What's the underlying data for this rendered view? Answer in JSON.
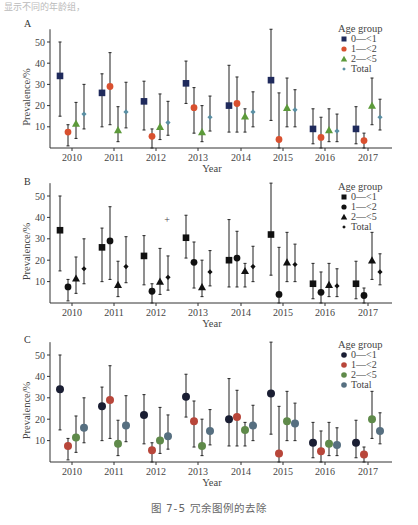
{
  "header": {
    "top_text": "显示不同的年龄组，"
  },
  "caption": "图 7-5   冗余图例的去除",
  "legend": {
    "title": "Age group",
    "items": [
      "0—<1",
      "1—<2",
      "2—<5",
      "Total"
    ]
  },
  "colors": {
    "a": [
      "#1f2a5c",
      "#d9502f",
      "#5c9a3a",
      "#5a8fa3"
    ],
    "b": [
      "#111111",
      "#111111",
      "#111111",
      "#111111"
    ],
    "c": [
      "#1a1e33",
      "#b8463a",
      "#5f8a4a",
      "#566f80"
    ]
  },
  "chart_data": [
    {
      "panel": "A",
      "type": "scatter",
      "subtype": "point-with-errorbars",
      "title": "",
      "xlabel": "Year",
      "ylabel": "Prevalence/%",
      "ylim": [
        0,
        55
      ],
      "yticks": [
        10,
        20,
        30,
        40,
        50
      ],
      "categories": [
        "2010",
        "2011",
        "2012",
        "2013",
        "2014",
        "2015",
        "2016",
        "2017"
      ],
      "legend_title": "Age group",
      "legend_position": "top-right",
      "marker_style": "shape+color (square, circle, triangle, diamond)",
      "series": [
        {
          "name": "0—<1",
          "values": [
            34,
            26,
            22,
            30.5,
            20,
            32,
            9,
            9
          ],
          "lower": [
            15,
            10,
            8.5,
            21,
            7.5,
            13,
            2,
            2
          ],
          "upper": [
            50,
            35,
            31.5,
            41,
            39,
            56,
            18.5,
            19.5
          ]
        },
        {
          "name": "1—<2",
          "values": [
            7.5,
            29,
            5.5,
            19,
            21,
            4,
            5,
            3.5
          ],
          "lower": [
            1,
            11,
            0,
            7,
            7.5,
            0,
            0,
            0
          ],
          "upper": [
            11,
            45,
            9,
            28.5,
            33.5,
            26,
            14.5,
            7
          ]
        },
        {
          "name": "2—<5",
          "values": [
            11.5,
            8.5,
            10,
            7.5,
            15,
            19,
            8.5,
            20
          ],
          "lower": [
            4.5,
            3,
            4,
            3,
            7.5,
            10,
            3,
            11
          ],
          "upper": [
            21.5,
            19.5,
            25.5,
            20,
            18.5,
            33,
            18.5,
            33
          ]
        },
        {
          "name": "Total",
          "values": [
            16,
            17,
            12,
            14.5,
            17,
            18,
            8,
            14.5
          ],
          "lower": [
            9,
            9.5,
            6,
            8,
            10,
            10,
            3,
            8.5
          ],
          "upper": [
            30,
            31,
            22,
            24.5,
            26.5,
            27.5,
            16,
            23
          ]
        }
      ]
    },
    {
      "panel": "B",
      "type": "scatter",
      "subtype": "point-with-errorbars",
      "xlabel": "Year",
      "ylabel": "Prevalence/%",
      "ylim": [
        0,
        55
      ],
      "yticks": [
        10,
        20,
        30,
        40,
        50
      ],
      "categories": [
        "2010",
        "2011",
        "2012",
        "2013",
        "2014",
        "2015",
        "2016",
        "2017"
      ],
      "legend_title": "Age group",
      "marker_style": "shape only (black)",
      "annotations": [
        {
          "text": "+",
          "x": "2012",
          "y": 39
        }
      ],
      "series": "same as panel A"
    },
    {
      "panel": "C",
      "type": "scatter",
      "subtype": "point-with-errorbars",
      "xlabel": "Year",
      "ylabel": "Prevalence/%",
      "ylim": [
        0,
        55
      ],
      "yticks": [
        10,
        20,
        30,
        40,
        50
      ],
      "categories": [
        "2010",
        "2011",
        "2012",
        "2013",
        "2014",
        "2015",
        "2016",
        "2017"
      ],
      "legend_title": "Age group",
      "marker_style": "color only (circles)",
      "series": "same as panel A"
    }
  ]
}
